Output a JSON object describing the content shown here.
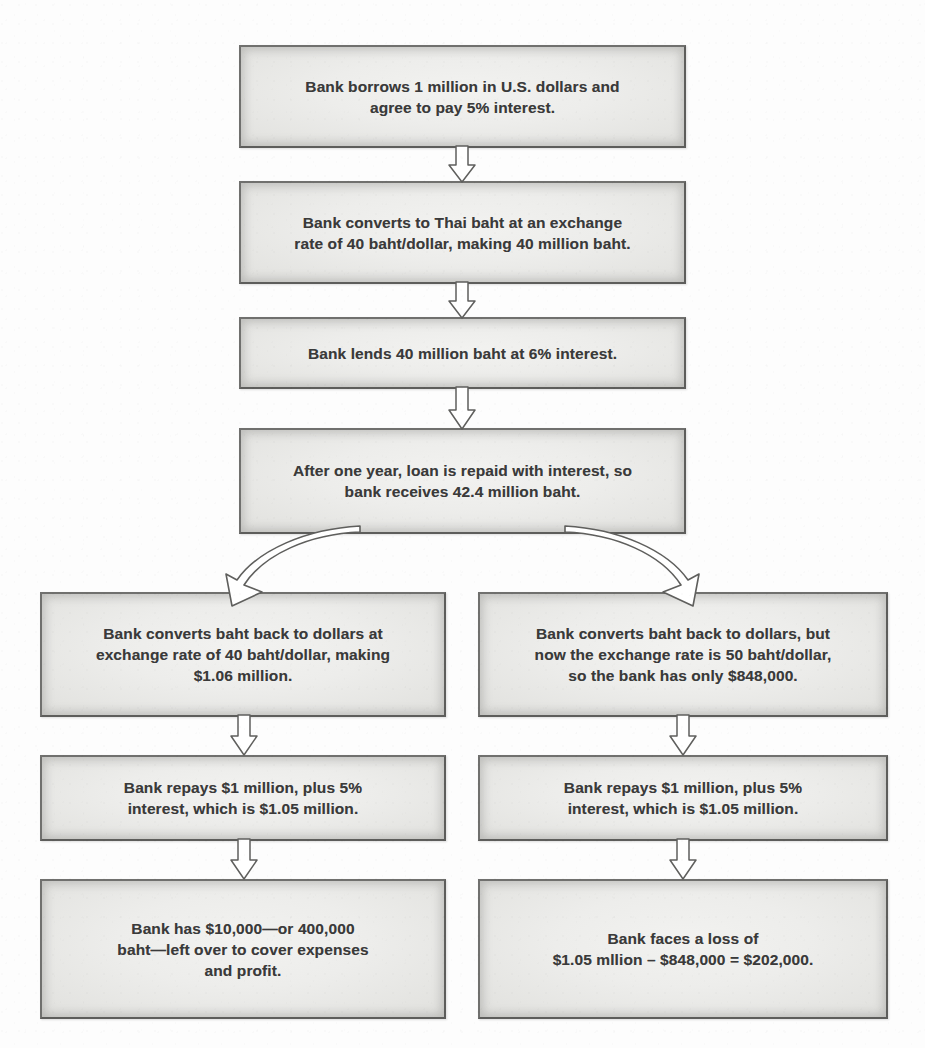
{
  "diagram": {
    "type": "flowchart",
    "orientation": "top-to-bottom with two-way branch",
    "colors": {
      "page_background": "#fdfdfd",
      "node_fill_center": "#f2f2f0",
      "node_fill_edge": "#c4c4c1",
      "node_border": "#70706e",
      "text": "#3a3a3a",
      "arrow_fill": "#ffffff",
      "arrow_outline": "#5f5f5d"
    },
    "nodes": [
      {
        "id": "n1",
        "name": "borrow-dollars",
        "text": "Bank borrows 1 million in U.S. dollars and\nagree to pay 5% interest."
      },
      {
        "id": "n2",
        "name": "convert-to-baht",
        "text": "Bank converts to Thai baht at an exchange\nrate of 40 baht/dollar, making 40 million baht."
      },
      {
        "id": "n3",
        "name": "lend-baht",
        "text": "Bank lends 40 million baht at 6% interest."
      },
      {
        "id": "n4",
        "name": "loan-repaid",
        "text": "After one year, loan is repaid with interest, so\nbank receives 42.4 million baht."
      },
      {
        "id": "n5",
        "name": "left-convert-back-stable-rate",
        "text": "Bank converts baht back to dollars at\nexchange rate of 40 baht/dollar, making\n$1.06 million."
      },
      {
        "id": "n6",
        "name": "right-convert-back-devalued-rate",
        "text": "Bank converts baht back to dollars, but\nnow the exchange rate is 50 baht/dollar,\nso the bank has only $848,000."
      },
      {
        "id": "n7",
        "name": "left-repay-loan",
        "text": "Bank repays $1 million, plus 5%\ninterest, which is $1.05 million."
      },
      {
        "id": "n8",
        "name": "right-repay-loan",
        "text": "Bank repays $1 million, plus 5%\ninterest, which is $1.05 million."
      },
      {
        "id": "n9",
        "name": "left-outcome-profit",
        "text": "Bank has $10,000—or 400,000\nbaht—left over to cover expenses\nand profit."
      },
      {
        "id": "n10",
        "name": "right-outcome-loss",
        "text": "Bank faces a loss of\n$1.05 mllion – $848,000 = $202,000."
      }
    ],
    "edges": [
      {
        "from": "n1",
        "to": "n2",
        "style": "straight-down-block-arrow"
      },
      {
        "from": "n2",
        "to": "n3",
        "style": "straight-down-block-arrow"
      },
      {
        "from": "n3",
        "to": "n4",
        "style": "straight-down-block-arrow"
      },
      {
        "from": "n4",
        "to": "n5",
        "style": "curved-block-arrow-left"
      },
      {
        "from": "n4",
        "to": "n6",
        "style": "curved-block-arrow-right"
      },
      {
        "from": "n5",
        "to": "n7",
        "style": "straight-down-block-arrow"
      },
      {
        "from": "n6",
        "to": "n8",
        "style": "straight-down-block-arrow"
      },
      {
        "from": "n7",
        "to": "n9",
        "style": "straight-down-block-arrow"
      },
      {
        "from": "n8",
        "to": "n10",
        "style": "straight-down-block-arrow"
      }
    ]
  }
}
